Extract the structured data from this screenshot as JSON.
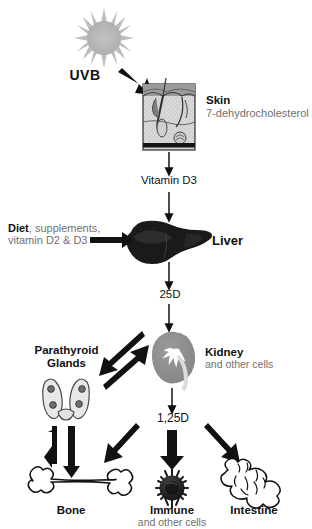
{
  "diagram": {
    "colors": {
      "ink": "#111111",
      "gray_text": "#6f6f6f",
      "sun": "#b9b9b9",
      "kidney": "#8f8f8f",
      "liver": "#1a1a1a",
      "immune": "#1c1c1c",
      "background": "#ffffff"
    }
  },
  "nodes": {
    "sun": {
      "icon": "sun-icon",
      "label": "UVB"
    },
    "skin": {
      "icon": "skin-histology-icon",
      "label_primary": "Skin",
      "label_secondary": "7-dehydrocholesterol"
    },
    "vitamin_d3": {
      "label": "Vitamin D3"
    },
    "diet": {
      "label_primary": "Diet",
      "label_secondary": ", supplements,",
      "label_line2": "vitamin D2 & D3"
    },
    "liver": {
      "icon": "liver-icon",
      "label": "Liver"
    },
    "twenty_five_d": {
      "label": "25D"
    },
    "kidney": {
      "icon": "kidney-icon",
      "label_primary": "Kidney",
      "label_secondary": "and other cells"
    },
    "parathyroid": {
      "icon": "thyroid-parathyroid-icon",
      "label_line1": "Parathyroid",
      "label_line2": "Glands"
    },
    "one_twentyfive_d": {
      "label": "1,25D"
    },
    "bone": {
      "icon": "bone-icon",
      "label": "Bone"
    },
    "immune": {
      "icon": "immune-cell-icon",
      "label_primary": "Immune",
      "label_secondary": "and other cells"
    },
    "intestine": {
      "icon": "intestine-icon",
      "label": "Intestine"
    }
  },
  "edges": [
    {
      "name": "uvb-to-skin",
      "from": "sun",
      "to": "skin",
      "style": "thick"
    },
    {
      "name": "skin-to-vitamin-d3",
      "from": "skin",
      "to": "vitamin_d3",
      "style": "thin"
    },
    {
      "name": "vitamin-d3-to-liver",
      "from": "vitamin_d3",
      "to": "liver",
      "style": "thin"
    },
    {
      "name": "diet-to-liver",
      "from": "diet",
      "to": "liver",
      "style": "thick"
    },
    {
      "name": "liver-to-25d",
      "from": "liver",
      "to": "twenty_five_d",
      "style": "thin"
    },
    {
      "name": "25d-to-kidney",
      "from": "twenty_five_d",
      "to": "kidney",
      "style": "thin"
    },
    {
      "name": "parathyroid-to-kidney",
      "from": "parathyroid",
      "to": "kidney",
      "style": "thick"
    },
    {
      "name": "kidney-to-parathyroid",
      "from": "kidney",
      "to": "parathyroid",
      "style": "thick"
    },
    {
      "name": "kidney-to-125d",
      "from": "kidney",
      "to": "one_twentyfive_d",
      "style": "thin"
    },
    {
      "name": "parathyroid-to-bone",
      "from": "parathyroid",
      "to": "bone",
      "style": "thick"
    },
    {
      "name": "bone-to-parathyroid",
      "from": "bone",
      "to": "parathyroid",
      "style": "thick"
    },
    {
      "name": "125d-to-bone",
      "from": "one_twentyfive_d",
      "to": "bone",
      "style": "thick"
    },
    {
      "name": "125d-to-immune",
      "from": "one_twentyfive_d",
      "to": "immune",
      "style": "thick"
    },
    {
      "name": "125d-to-intestine",
      "from": "one_twentyfive_d",
      "to": "intestine",
      "style": "thick"
    }
  ]
}
